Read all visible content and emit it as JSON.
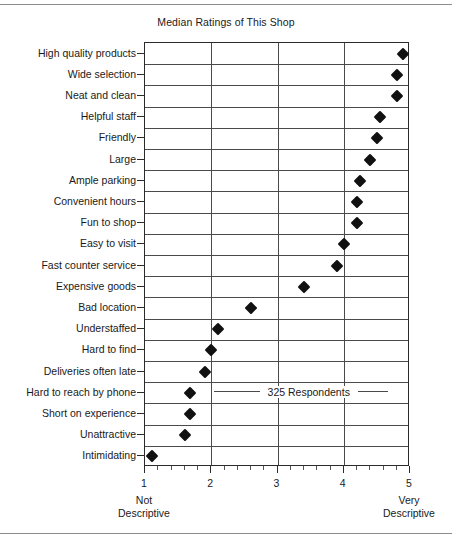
{
  "chart_data": {
    "type": "scatter",
    "title": "Median Ratings of This Shop",
    "xlabel": "",
    "ylabel": "",
    "xlim": [
      1,
      5
    ],
    "xticks": [
      1,
      2,
      3,
      4,
      5
    ],
    "xticklabels": [
      "1",
      "2",
      "3",
      "4",
      "5"
    ],
    "grid": true,
    "legend": "none",
    "orientation": "horizontal",
    "marker": "diamond",
    "marker_color": "#111111",
    "categories": [
      "High quality products",
      "Wide selection",
      "Neat and clean",
      "Helpful staff",
      "Friendly",
      "Large",
      "Ample parking",
      "Convenient hours",
      "Fun to shop",
      "Easy to visit",
      "Fast counter service",
      "Expensive goods",
      "Bad location",
      "Understaffed",
      "Hard to find",
      "Deliveries often late",
      "Hard to reach by phone",
      "Short on experience",
      "Unattractive",
      "Intimidating"
    ],
    "values": [
      4.9,
      4.8,
      4.8,
      4.55,
      4.5,
      4.4,
      4.25,
      4.2,
      4.2,
      4.0,
      3.9,
      3.4,
      2.6,
      2.1,
      2.0,
      1.9,
      1.68,
      1.68,
      1.6,
      1.1
    ],
    "annotations": [
      {
        "text": "325 Respondents",
        "at_category": "Hard to reach by phone"
      }
    ],
    "axis_anchors": {
      "low": {
        "line1": "Not",
        "line2": "Descriptive",
        "value": 1
      },
      "high": {
        "line1": "Very",
        "line2": "Descriptive",
        "value": 5
      }
    }
  }
}
